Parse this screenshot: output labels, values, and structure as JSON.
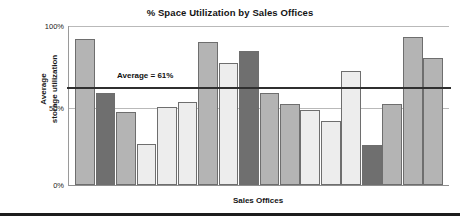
{
  "chart_data": {
    "type": "bar",
    "title": "% Space Utilization by Sales Offices",
    "xlabel": "Sales Offices",
    "ylabel": "Average storage utilization",
    "ylabel_lines": [
      "Average",
      "storage utilization"
    ],
    "ylim": [
      0,
      100
    ],
    "ytick_labels": [
      "0%",
      "50%",
      "100%"
    ],
    "ytick_values": [
      0,
      50,
      100
    ],
    "xtick_labels": [],
    "grid": true,
    "legend": null,
    "annotations": [
      {
        "text": "Average = 61%",
        "value": 61,
        "kind": "horizontal-reference-line"
      }
    ],
    "categories": [
      "Office 1",
      "Office 2",
      "Office 3",
      "Office 4",
      "Office 5",
      "Office 6",
      "Office 7",
      "Office 8",
      "Office 9",
      "Office 10",
      "Office 11",
      "Office 12",
      "Office 13",
      "Office 14",
      "Office 15",
      "Office 16",
      "Office 17",
      "Office 18"
    ],
    "values": [
      92,
      58,
      46,
      26,
      49,
      52,
      90,
      77,
      84,
      58,
      51,
      47,
      40,
      72,
      25,
      51,
      93,
      80
    ],
    "bar_shades": [
      "medium",
      "dark",
      "medium",
      "light",
      "light",
      "light",
      "medium",
      "light",
      "dark",
      "medium",
      "medium",
      "light",
      "light",
      "light",
      "dark",
      "medium",
      "medium",
      "medium"
    ],
    "shade_colors": {
      "light": "#ededed",
      "medium": "#b4b4b4",
      "dark": "#6f6f6f"
    },
    "average_line_color": "#2f2f2f",
    "gridline_color": "#b9b9b9",
    "axis_color": "#8e8e8e",
    "background_color": "#ffffff"
  }
}
